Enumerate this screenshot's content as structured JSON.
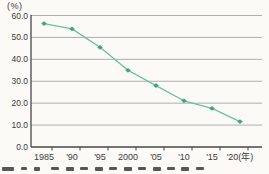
{
  "chart": {
    "unit_label": "(%)"
  },
  "chart_data": {
    "type": "line",
    "categories": [
      "1985",
      "'90",
      "'95",
      "2000",
      "'05",
      "'10",
      "'15",
      "'20(年)"
    ],
    "values": [
      56.3,
      53.9,
      45.5,
      35.0,
      28.0,
      21.1,
      17.6,
      11.6
    ],
    "series_name": "",
    "title": "",
    "xlabel": "年",
    "ylabel": "%",
    "unit_label": "(%)",
    "ylim": [
      0,
      60
    ],
    "ytick_step": 10,
    "ytick_labels": [
      "0.0",
      "10.0",
      "20.0",
      "30.0",
      "40.0",
      "50.0",
      "60.0"
    ],
    "grid": true,
    "legend": "none",
    "marker_shape": "diamond",
    "colors": {
      "line": "#6cbfa0",
      "marker": "#41a382",
      "gridline": "#a6a6a6",
      "axis": "#474747",
      "tick_text": "#3c3c3c",
      "background": "#fbfaf7"
    }
  }
}
